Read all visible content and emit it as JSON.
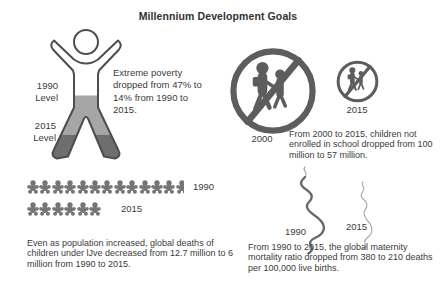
{
  "title": "Millennium Development Goals",
  "colors": {
    "text": "#3b3b3b",
    "icon_gray": "#5d5d5d",
    "fill_1990_level": "#a6a6a6",
    "fill_2015_level": "#6e6e6e",
    "outline": "#4d4d4d",
    "baby_gray": "#757575"
  },
  "icons": {
    "poverty": "person-outline-icon",
    "school": "no-children-sign-icon",
    "child_deaths": "child-figure-icon",
    "maternal": "pregnant-profile-icon"
  },
  "sections": {
    "poverty": {
      "figure_label_1990": "1990 Level",
      "figure_label_2015": "2015 Level",
      "text": "Extreme poverty dropped from 47% to 14% from 1990 to 2015."
    },
    "school": {
      "label_large": "2000",
      "label_small": "2015",
      "text": "From 2000 to 2015, children not enrolled in school dropped from 100 million to 57 million."
    },
    "child_deaths": {
      "label_1990": "1990",
      "label_2015": "2015",
      "count_1990": 12.7,
      "count_2015": 6,
      "text": "Even as population increased, global deaths of children under lJve decreased from 12.7 million to 6 million from 1990 to 2015."
    },
    "maternal": {
      "label_1990": "1990",
      "label_2015": "2015",
      "text": "From 1990 to 2015, the global maternity mortality ratio dropped from 380 to 210 deaths per 100,000 live births."
    }
  },
  "chart_data": [
    {
      "type": "pictogram",
      "title": "Extreme poverty rate",
      "categories": [
        "1990",
        "2015"
      ],
      "values": [
        47,
        14
      ],
      "ylabel": "% of population in extreme poverty"
    },
    {
      "type": "pictogram",
      "title": "Children not enrolled in school",
      "categories": [
        "2000",
        "2015"
      ],
      "values": [
        100,
        57
      ],
      "ylabel": "million children"
    },
    {
      "type": "pictogram",
      "title": "Global deaths of children under five",
      "categories": [
        "1990",
        "2015"
      ],
      "values": [
        12.7,
        6
      ],
      "ylabel": "million deaths"
    },
    {
      "type": "pictogram",
      "title": "Global maternal mortality ratio",
      "categories": [
        "1990",
        "2015"
      ],
      "values": [
        380,
        210
      ],
      "ylabel": "deaths per 100,000 live births"
    }
  ]
}
